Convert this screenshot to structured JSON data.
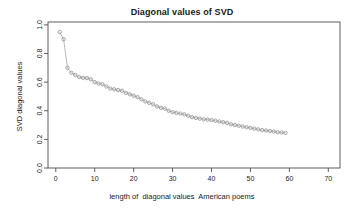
{
  "chart_data": {
    "type": "scatter",
    "title": "Diagonal values of SVD",
    "xlabel": "length of  diagonal values  American poems",
    "ylabel": "SVD diagonal values",
    "xlim": [
      -2,
      73
    ],
    "ylim": [
      0.0,
      1.02
    ],
    "xticks": [
      0,
      10,
      20,
      30,
      40,
      50,
      60,
      70
    ],
    "xtick_labels": [
      "0",
      "10",
      "20",
      "30",
      "40",
      "50",
      "60",
      "70"
    ],
    "yticks": [
      0.0,
      0.2,
      0.4,
      0.6,
      0.8,
      1.0
    ],
    "ytick_labels": [
      "0.0",
      "0.2",
      "0.4",
      "0.6",
      "0.8",
      "1.0"
    ],
    "grid": false,
    "legend": null,
    "marker": "open-circle",
    "marker_color": "#8c8c8c",
    "line_color": "#8c8c8c",
    "series": [
      {
        "name": "SVD diagonal values",
        "x": [
          1,
          2,
          3,
          4,
          5,
          6,
          7,
          8,
          9,
          10,
          11,
          12,
          13,
          14,
          15,
          16,
          17,
          18,
          19,
          20,
          21,
          22,
          23,
          24,
          25,
          26,
          27,
          28,
          29,
          30,
          31,
          32,
          33,
          34,
          35,
          36,
          37,
          38,
          39,
          40,
          41,
          42,
          43,
          44,
          45,
          46,
          47,
          48,
          49,
          50,
          51,
          52,
          53,
          54,
          55,
          56,
          57,
          58,
          59
        ],
        "values": [
          0.95,
          0.9,
          0.7,
          0.665,
          0.65,
          0.635,
          0.63,
          0.628,
          0.62,
          0.6,
          0.59,
          0.585,
          0.57,
          0.555,
          0.55,
          0.545,
          0.54,
          0.525,
          0.515,
          0.505,
          0.495,
          0.48,
          0.465,
          0.455,
          0.445,
          0.43,
          0.42,
          0.415,
          0.4,
          0.39,
          0.385,
          0.38,
          0.375,
          0.365,
          0.355,
          0.35,
          0.345,
          0.34,
          0.338,
          0.335,
          0.33,
          0.325,
          0.32,
          0.315,
          0.305,
          0.3,
          0.295,
          0.29,
          0.285,
          0.28,
          0.275,
          0.27,
          0.265,
          0.262,
          0.258,
          0.255,
          0.25,
          0.248,
          0.245
        ]
      }
    ]
  },
  "axis": {
    "x_axis_name": "x-axis",
    "y_axis_name": "y-axis"
  }
}
